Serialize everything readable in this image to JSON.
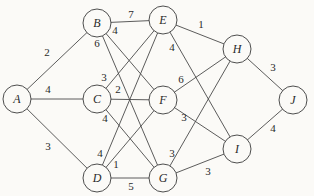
{
  "graph": {
    "nodes": [
      {
        "id": "A",
        "label": "A",
        "x": 17,
        "y": 99
      },
      {
        "id": "B",
        "label": "B",
        "x": 97,
        "y": 23
      },
      {
        "id": "C",
        "label": "C",
        "x": 97,
        "y": 99
      },
      {
        "id": "D",
        "label": "D",
        "x": 97,
        "y": 178
      },
      {
        "id": "E",
        "label": "E",
        "x": 163,
        "y": 20
      },
      {
        "id": "F",
        "label": "F",
        "x": 163,
        "y": 100
      },
      {
        "id": "G",
        "label": "G",
        "x": 163,
        "y": 178
      },
      {
        "id": "H",
        "label": "H",
        "x": 237,
        "y": 49
      },
      {
        "id": "I",
        "label": "I",
        "x": 237,
        "y": 149
      },
      {
        "id": "J",
        "label": "J",
        "x": 293,
        "y": 100
      }
    ],
    "edges": [
      {
        "from": "A",
        "to": "B",
        "weight": "2",
        "lx": 47,
        "ly": 52
      },
      {
        "from": "A",
        "to": "C",
        "weight": "4",
        "lx": 48,
        "ly": 89
      },
      {
        "from": "A",
        "to": "D",
        "weight": "3",
        "lx": 48,
        "ly": 146
      },
      {
        "from": "B",
        "to": "E",
        "weight": "7",
        "lx": 131,
        "ly": 14
      },
      {
        "from": "B",
        "to": "F",
        "weight": "4",
        "lx": 115,
        "ly": 30
      },
      {
        "from": "B",
        "to": "G",
        "weight": "6",
        "lx": 97,
        "ly": 43
      },
      {
        "from": "C",
        "to": "E",
        "weight": "3",
        "lx": 104,
        "ly": 77
      },
      {
        "from": "C",
        "to": "F",
        "weight": "2",
        "lx": 118,
        "ly": 89
      },
      {
        "from": "C",
        "to": "G",
        "weight": "4",
        "lx": 105,
        "ly": 118
      },
      {
        "from": "D",
        "to": "E",
        "weight": "4",
        "lx": 100,
        "ly": 153
      },
      {
        "from": "D",
        "to": "F",
        "weight": "1",
        "lx": 116,
        "ly": 164
      },
      {
        "from": "D",
        "to": "G",
        "weight": "5",
        "lx": 131,
        "ly": 186
      },
      {
        "from": "E",
        "to": "H",
        "weight": "1",
        "lx": 201,
        "ly": 24
      },
      {
        "from": "E",
        "to": "I",
        "weight": "4",
        "lx": 172,
        "ly": 47
      },
      {
        "from": "F",
        "to": "H",
        "weight": "6",
        "lx": 181,
        "ly": 79
      },
      {
        "from": "F",
        "to": "I",
        "weight": "3",
        "lx": 184,
        "ly": 117
      },
      {
        "from": "G",
        "to": "H",
        "weight": "3",
        "lx": 172,
        "ly": 153
      },
      {
        "from": "G",
        "to": "I",
        "weight": "3",
        "lx": 208,
        "ly": 171
      },
      {
        "from": "H",
        "to": "J",
        "weight": "3",
        "lx": 273,
        "ly": 67
      },
      {
        "from": "I",
        "to": "J",
        "weight": "4",
        "lx": 273,
        "ly": 128
      }
    ],
    "node_radius": 14
  }
}
